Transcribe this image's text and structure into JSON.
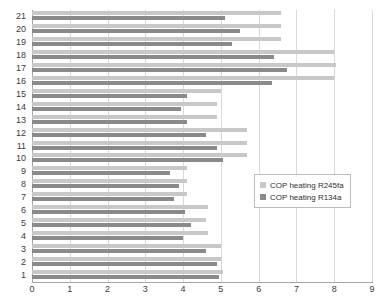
{
  "chart_data": {
    "type": "bar",
    "orientation": "horizontal",
    "title": "",
    "subtitle": "",
    "xlabel": "",
    "ylabel": "",
    "xlim": [
      0,
      9
    ],
    "ylim": [
      1,
      21
    ],
    "grid": true,
    "legend_position": "middle-right",
    "x_ticks": [
      0,
      1,
      2,
      3,
      4,
      5,
      6,
      7,
      8,
      9
    ],
    "x_tick_labels": [
      "0",
      "1",
      "2",
      "3",
      "4",
      "5",
      "6",
      "7",
      "8",
      "9"
    ],
    "categories": [
      21,
      20,
      19,
      18,
      17,
      16,
      15,
      14,
      13,
      12,
      11,
      10,
      9,
      8,
      7,
      6,
      5,
      4,
      3,
      2,
      1
    ],
    "category_labels": [
      "21",
      "20",
      "19",
      "18",
      "17",
      "16",
      "15",
      "14",
      "13",
      "12",
      "11",
      "10",
      "9",
      "8",
      "7",
      "6",
      "5",
      "4",
      "3",
      "2",
      "1"
    ],
    "series": [
      {
        "name": "COP heating R245fa",
        "color": "#c8c8c8",
        "values": [
          6.6,
          6.6,
          6.6,
          8.0,
          8.05,
          8.0,
          5.0,
          4.9,
          4.9,
          5.7,
          5.7,
          5.7,
          4.1,
          4.1,
          4.1,
          4.65,
          4.6,
          4.65,
          5.0,
          5.0,
          5.05
        ]
      },
      {
        "name": "COP heating R134a",
        "color": "#8a8a8a",
        "values": [
          5.1,
          5.5,
          5.3,
          6.4,
          6.75,
          6.35,
          4.1,
          3.95,
          4.1,
          4.6,
          4.9,
          5.05,
          3.65,
          3.9,
          3.75,
          4.05,
          4.2,
          4.0,
          4.6,
          4.9,
          4.95
        ]
      }
    ]
  },
  "legend": {
    "entries": [
      {
        "label": "COP heating R245fa",
        "color": "#c8c8c8"
      },
      {
        "label": "COP heating R134a",
        "color": "#8a8a8a"
      }
    ]
  },
  "colors": {
    "series_light": "#c8c8c8",
    "series_dark": "#8a8a8a",
    "gridline": "#d9d9d9",
    "axis": "#a6a6a6",
    "text": "#3b3b3b",
    "background": "#ffffff"
  }
}
